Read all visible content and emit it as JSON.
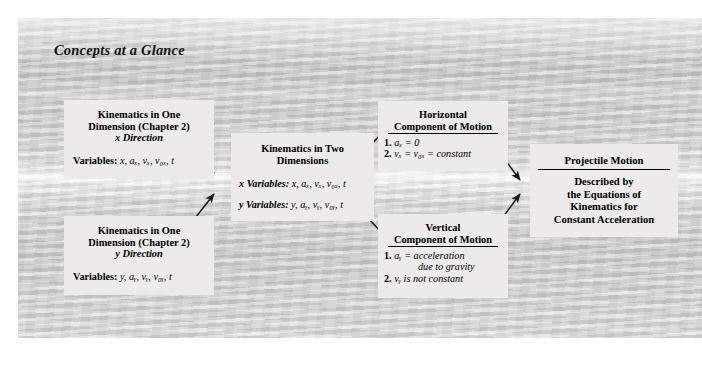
{
  "folio": "88",
  "figure": {
    "label": "Concepts at a Glance"
  },
  "boxes": {
    "kinematics_x": {
      "title_line1": "Kinematics in One",
      "title_line2": "Dimension (Chapter 2)",
      "title_line3": "x Direction",
      "vars_label": "Variables:",
      "vars_value": "x, aₓ, vₓ, v₀ₓ, t"
    },
    "kinematics_y": {
      "title_line1": "Kinematics in One",
      "title_line2": "Dimension (Chapter 2)",
      "title_line3": "y Direction",
      "vars_label": "Variables:",
      "vars_value": "y, aᵧ, vᵧ, v₀ᵧ, t"
    },
    "kinematics_2d": {
      "title_line1": "Kinematics in Two",
      "title_line2": "Dimensions",
      "x_vars_label": "x Variables:",
      "x_vars_value": "x, aₓ, vₓ, v₀ₓ, t",
      "y_vars_label": "y Variables:",
      "y_vars_value": "y, aᵧ, vᵧ, v₀ᵧ, t"
    },
    "horizontal": {
      "title_line1": "Horizontal",
      "title_line2": "Component of Motion",
      "item1_num": "1.",
      "item1_text": "aₓ = 0",
      "item2_num": "2.",
      "item2_text": "vₓ = v₀ₓ = constant"
    },
    "vertical": {
      "title_line1": "Vertical",
      "title_line2": "Component of Motion",
      "item1_num": "1.",
      "item1_text": "aᵧ = acceleration",
      "item1_text_cont": "due to gravity",
      "item2_num": "2.",
      "item2_text": "vᵧ is not constant"
    },
    "projectile": {
      "title": "Projectile Motion",
      "line1": "Described by",
      "line2": "the Equations of",
      "line3": "Kinematics for",
      "line4": "Constant Acceleration"
    }
  },
  "colors": {
    "box_fill": "#eceaea",
    "text": "#000000",
    "arrow": "#1a1a1a"
  }
}
